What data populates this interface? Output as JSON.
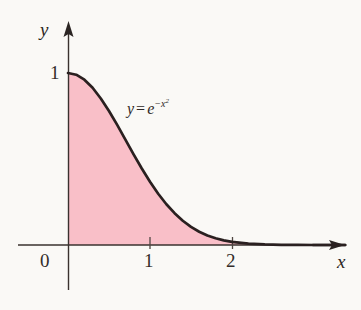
{
  "figure": {
    "title": "",
    "background_color": "#faf9f6"
  },
  "axes": {
    "x_axis_name": "x",
    "y_axis_name": "y",
    "origin_label": "0",
    "x_ticks": [
      {
        "value": 1,
        "label": "1"
      },
      {
        "value": 2,
        "label": "2"
      }
    ],
    "y_ticks": [
      {
        "value": 1,
        "label": "1"
      }
    ]
  },
  "annotation": {
    "equation_y": "y",
    "equation_eq": "=",
    "equation_base": "e",
    "equation_exponent": "−x",
    "equation_exponent_power": "2",
    "equation_plain": "y = e^(-x^2)"
  },
  "colors": {
    "fill": "#f9bfc8",
    "curve": "#2a2020",
    "axis": "#3a322f",
    "text": "#2b2523"
  },
  "chart_data": {
    "type": "area",
    "title": "",
    "xlabel": "x",
    "ylabel": "y",
    "xlim": [
      -0.6,
      3.38
    ],
    "ylim": [
      -0.26,
      1.3
    ],
    "grid": false,
    "legend": "none",
    "series": [
      {
        "name": "y = e^(-x^2)",
        "expression": "exp(-x^2)",
        "fill": true,
        "fill_from": 0,
        "fill_domain": [
          0,
          3.38
        ],
        "x": [
          0,
          0.1,
          0.2,
          0.3,
          0.4,
          0.5,
          0.6,
          0.7,
          0.8,
          0.9,
          1.0,
          1.1,
          1.2,
          1.3,
          1.4,
          1.5,
          1.6,
          1.7,
          1.8,
          1.9,
          2.0,
          2.2,
          2.4,
          2.6,
          2.8,
          3.0,
          3.2,
          3.38
        ],
        "y": [
          1.0,
          0.99,
          0.961,
          0.914,
          0.852,
          0.779,
          0.698,
          0.613,
          0.527,
          0.445,
          0.368,
          0.298,
          0.237,
          0.185,
          0.141,
          0.105,
          0.077,
          0.055,
          0.039,
          0.027,
          0.018,
          0.0077,
          0.0032,
          0.0012,
          0.00039,
          0.00012,
          3.6e-05,
          1.09e-05
        ]
      }
    ],
    "annotations": [
      {
        "text": "y = e^(-x^2)",
        "x": 0.85,
        "y": 0.82
      }
    ]
  }
}
